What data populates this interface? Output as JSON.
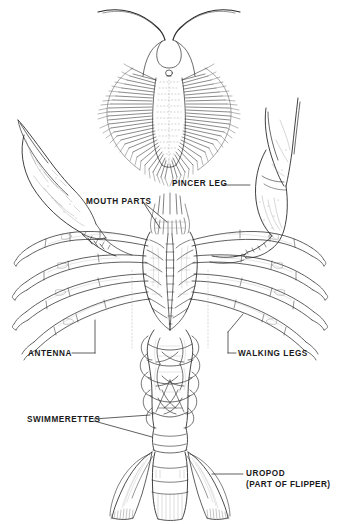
{
  "figure": {
    "background_color": "#ffffff",
    "ink_color": "#1a1a1a",
    "width": 337,
    "height": 524
  },
  "labels": [
    {
      "id": "pincer-leg",
      "text": "PINCER LEG",
      "sub": ""
    },
    {
      "id": "mouth-parts",
      "text": "MOUTH PARTS",
      "sub": ""
    },
    {
      "id": "antenna",
      "text": "ANTENNA",
      "sub": ""
    },
    {
      "id": "walking-legs",
      "text": "WALKING LEGS",
      "sub": ""
    },
    {
      "id": "swimmerettes",
      "text": "SWIMMERETTES",
      "sub": ""
    },
    {
      "id": "uropod",
      "text": "UROPOD",
      "sub": "(PART OF FLIPPER)"
    }
  ],
  "parts": {
    "larva": "larval-stage-figure",
    "left_claw": "left-pincer-claw",
    "right_claw": "right-pincer-claw",
    "carapace": "cephalothorax",
    "abdomen": "segmented-abdomen",
    "tail_fan": "tail-fan-uropods",
    "telson": "telson"
  }
}
